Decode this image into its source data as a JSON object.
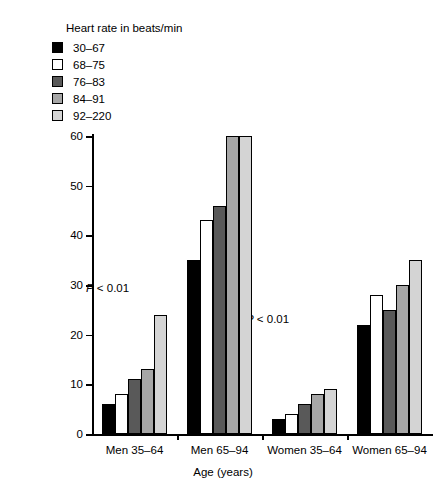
{
  "legend": {
    "title": "Heart rate in beats/min",
    "items": [
      {
        "label": "30–67",
        "color": "#000000"
      },
      {
        "label": "68–75",
        "color": "#ffffff"
      },
      {
        "label": "76–83",
        "color": "#595959"
      },
      {
        "label": "84–91",
        "color": "#a6a6a6"
      },
      {
        "label": "92–220",
        "color": "#d4d4d4"
      }
    ]
  },
  "axes": {
    "y_title": "Age-adjusted 2-year rate per 1000",
    "x_title": "Age (years)",
    "y_ticks": [
      "0",
      "10",
      "20",
      "30",
      "40",
      "50",
      "60"
    ]
  },
  "annotations": [
    {
      "prefix": "P",
      "rest": " < 0.01",
      "left": "86px",
      "top": "282px"
    },
    {
      "prefix": "P",
      "rest": " < 0.01",
      "left": "246px",
      "top": "313px"
    }
  ],
  "chart_data": {
    "type": "bar",
    "title": "",
    "xlabel": "Age (years)",
    "ylabel": "Age-adjusted 2-year rate per 1000",
    "ylim": [
      0,
      60
    ],
    "yticks": [
      0,
      10,
      20,
      30,
      40,
      50,
      60
    ],
    "grid": false,
    "legend_title": "Heart rate in beats/min",
    "legend_position": "top-left",
    "categories": [
      "Men 35–64",
      "Men 65–94",
      "Women 35–64",
      "Women 65–94"
    ],
    "series": [
      {
        "name": "30–67",
        "color": "#000000",
        "values": [
          6,
          35,
          3,
          22
        ]
      },
      {
        "name": "68–75",
        "color": "#ffffff",
        "values": [
          8,
          43,
          4,
          28
        ]
      },
      {
        "name": "76–83",
        "color": "#595959",
        "values": [
          11,
          46,
          6,
          25
        ]
      },
      {
        "name": "84–91",
        "color": "#a6a6a6",
        "values": [
          13,
          60,
          8,
          30
        ]
      },
      {
        "name": "92–220",
        "color": "#d4d4d4",
        "values": [
          24,
          60,
          9,
          35
        ]
      }
    ],
    "annotations": [
      "P < 0.01",
      "P < 0.01"
    ]
  }
}
